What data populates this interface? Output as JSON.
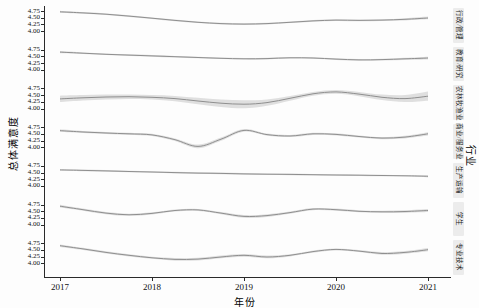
{
  "axes": {
    "x_label": "年份",
    "y_label": "总体满意度",
    "strip_title": "行业"
  },
  "chart_data": {
    "type": "line",
    "faceted": true,
    "title": "",
    "xlabel": "年份",
    "ylabel": "总体满意度",
    "facet_axis_label": "行业",
    "grid": false,
    "legend": "none",
    "x_ticks": [
      2017,
      2018,
      2019,
      2020,
      2021
    ],
    "x_tick_labels": [
      "2017",
      "2018",
      "2019",
      "2020",
      "2021"
    ],
    "y_tick_labels": [
      "4.75",
      "4.50",
      "4.25",
      "4.00"
    ],
    "y_ticks": [
      4.75,
      4.5,
      4.25,
      4.0
    ],
    "ylim_per_facet": [
      3.85,
      4.85
    ],
    "x": [
      2017,
      2017.25,
      2017.5,
      2017.75,
      2018,
      2018.25,
      2018.5,
      2018.75,
      2019,
      2019.25,
      2019.5,
      2019.75,
      2020,
      2020.25,
      2020.5,
      2020.75,
      2021
    ],
    "line_color": "#8f8f8f",
    "ribbon_color": "#d7d7d7",
    "facets": [
      {
        "label": "行政/管理",
        "values": [
          4.72,
          4.68,
          4.63,
          4.56,
          4.48,
          4.4,
          4.33,
          4.28,
          4.26,
          4.28,
          4.33,
          4.38,
          4.41,
          4.4,
          4.41,
          4.44,
          4.49
        ],
        "ci_halfwidth": [
          0.04,
          0.03,
          0.03,
          0.03,
          0.03,
          0.03,
          0.03,
          0.03,
          0.03,
          0.03,
          0.03,
          0.03,
          0.03,
          0.03,
          0.03,
          0.04,
          0.05
        ]
      },
      {
        "label": "教育/研究",
        "values": [
          4.66,
          4.62,
          4.58,
          4.55,
          4.52,
          4.49,
          4.46,
          4.43,
          4.41,
          4.42,
          4.45,
          4.44,
          4.4,
          4.37,
          4.38,
          4.41,
          4.44
        ],
        "ci_halfwidth": [
          0.04,
          0.03,
          0.03,
          0.03,
          0.03,
          0.03,
          0.03,
          0.03,
          0.03,
          0.03,
          0.03,
          0.03,
          0.03,
          0.03,
          0.03,
          0.04,
          0.05
        ]
      },
      {
        "label": "农林牧渔业",
        "values": [
          4.36,
          4.4,
          4.43,
          4.44,
          4.42,
          4.37,
          4.28,
          4.2,
          4.16,
          4.22,
          4.38,
          4.55,
          4.62,
          4.54,
          4.42,
          4.37,
          4.46
        ],
        "ci_halfwidth": [
          0.12,
          0.1,
          0.09,
          0.08,
          0.08,
          0.1,
          0.12,
          0.14,
          0.15,
          0.12,
          0.09,
          0.07,
          0.07,
          0.08,
          0.1,
          0.13,
          0.17
        ]
      },
      {
        "label": "商业/服务业",
        "values": [
          4.62,
          4.57,
          4.53,
          4.5,
          4.46,
          4.28,
          4.03,
          4.3,
          4.63,
          4.47,
          4.42,
          4.5,
          4.48,
          4.4,
          4.34,
          4.38,
          4.5
        ],
        "ci_halfwidth": [
          0.05,
          0.04,
          0.04,
          0.04,
          0.04,
          0.05,
          0.07,
          0.06,
          0.05,
          0.04,
          0.04,
          0.04,
          0.04,
          0.04,
          0.04,
          0.05,
          0.06
        ]
      },
      {
        "label": "生产运输",
        "values": [
          4.6,
          4.58,
          4.56,
          4.54,
          4.52,
          4.5,
          4.48,
          4.47,
          4.45,
          4.44,
          4.43,
          4.42,
          4.41,
          4.4,
          4.39,
          4.38,
          4.36
        ],
        "ci_halfwidth": [
          0.03,
          0.03,
          0.03,
          0.03,
          0.03,
          0.03,
          0.03,
          0.03,
          0.03,
          0.03,
          0.03,
          0.03,
          0.03,
          0.03,
          0.03,
          0.03,
          0.04
        ]
      },
      {
        "label": "学生",
        "values": [
          4.69,
          4.56,
          4.43,
          4.37,
          4.42,
          4.53,
          4.55,
          4.43,
          4.31,
          4.34,
          4.45,
          4.58,
          4.56,
          4.5,
          4.48,
          4.49,
          4.53
        ],
        "ci_halfwidth": [
          0.05,
          0.04,
          0.04,
          0.04,
          0.04,
          0.04,
          0.04,
          0.04,
          0.05,
          0.05,
          0.04,
          0.04,
          0.04,
          0.04,
          0.04,
          0.05,
          0.06
        ]
      },
      {
        "label": "专业技术",
        "values": [
          4.66,
          4.54,
          4.41,
          4.3,
          4.21,
          4.15,
          4.16,
          4.24,
          4.3,
          4.24,
          4.3,
          4.44,
          4.52,
          4.46,
          4.37,
          4.41,
          4.51
        ],
        "ci_halfwidth": [
          0.05,
          0.04,
          0.04,
          0.04,
          0.04,
          0.05,
          0.05,
          0.05,
          0.05,
          0.05,
          0.04,
          0.04,
          0.04,
          0.04,
          0.05,
          0.05,
          0.06
        ]
      }
    ]
  }
}
